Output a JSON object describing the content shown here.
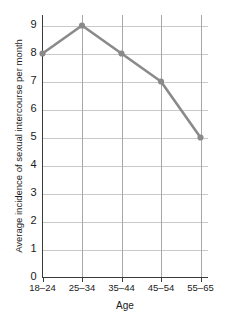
{
  "chart_data": {
    "type": "line",
    "title": "",
    "subtitle": "",
    "xlabel": "Age",
    "ylabel": "Average incidence of sexual intercourse per month",
    "categories": [
      "18–24",
      "25–34",
      "35–44",
      "45–54",
      "55–65"
    ],
    "values": [
      8,
      9,
      8,
      7,
      5
    ],
    "series": [
      {
        "name": "Average incidence of sexual intercourse per month",
        "values": [
          8,
          9,
          8,
          7,
          5
        ]
      }
    ],
    "ylim": [
      0,
      9
    ],
    "yticks": [
      0,
      1,
      2,
      3,
      4,
      5,
      6,
      7,
      8,
      9
    ],
    "ytick_labels": [
      "0",
      "1",
      "2",
      "3",
      "4",
      "5",
      "6",
      "7",
      "8",
      "9"
    ],
    "xtick_labels": [
      "18–24",
      "25–34",
      "35–44",
      "45–54",
      "55–65"
    ],
    "grid": true,
    "grid_axes": "both",
    "legend": false,
    "legend_position": "none",
    "annotations": [],
    "colors": {
      "line": "#8a8a8a",
      "marker": "#8a8a8a",
      "gridline_horizontal": "#c9c9c9",
      "gridline_vertical": "#a8a8a8",
      "axis": "#3a3a3a",
      "text": "#1a1a1a",
      "background": "#ffffff"
    }
  }
}
